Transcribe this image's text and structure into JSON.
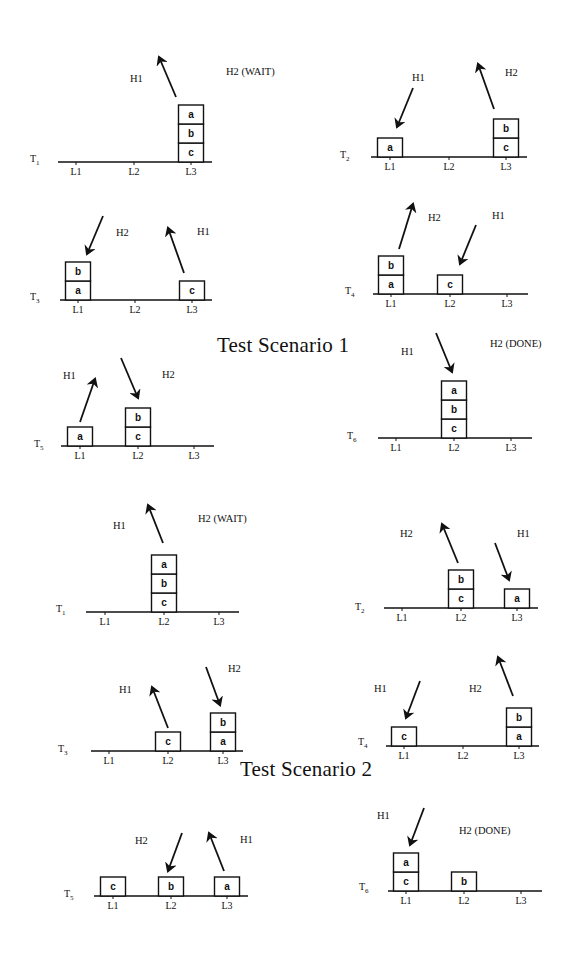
{
  "captions": [
    {
      "id": "scenario-1",
      "text": "Test Scenario 1",
      "x": 217,
      "y": 353
    },
    {
      "id": "scenario-2",
      "text": "Test Scenario 2",
      "x": 240,
      "y": 777
    }
  ],
  "colors": {
    "ink": "#111111",
    "background": "#ffffff"
  },
  "block_size": {
    "w": 25,
    "h": 19
  },
  "panels": [
    {
      "scenario": 1,
      "time": "T1",
      "sub": "1",
      "time_pos": [
        30,
        162
      ],
      "ground": {
        "x1": 58,
        "x2": 212,
        "y": 162
      },
      "locations": [
        {
          "name": "L1",
          "x": 76
        },
        {
          "name": "L2",
          "x": 134
        },
        {
          "name": "L3",
          "x": 191
        }
      ],
      "stacks": [
        {
          "loc": "L3",
          "blocks": [
            "c",
            "b",
            "a"
          ]
        }
      ],
      "arrows": [
        {
          "hand": "H1",
          "dir": "up",
          "x1": 176,
          "y1": 97,
          "x2": 159,
          "y2": 57
        }
      ],
      "hands": [
        {
          "text": "H1",
          "x": 130,
          "y": 82
        },
        {
          "text": "H2 (WAIT)",
          "x": 226,
          "y": 75
        }
      ]
    },
    {
      "scenario": 1,
      "time": "T2",
      "sub": "2",
      "time_pos": [
        340,
        158
      ],
      "ground": {
        "x1": 371,
        "x2": 527,
        "y": 157
      },
      "locations": [
        {
          "name": "L1",
          "x": 390
        },
        {
          "name": "L2",
          "x": 449
        },
        {
          "name": "L3",
          "x": 506
        }
      ],
      "stacks": [
        {
          "loc": "L1",
          "blocks": [
            "a"
          ]
        },
        {
          "loc": "L3",
          "blocks": [
            "c",
            "b"
          ]
        }
      ],
      "arrows": [
        {
          "hand": "H1",
          "dir": "down",
          "x1": 413,
          "y1": 88,
          "x2": 397,
          "y2": 127
        },
        {
          "hand": "H2",
          "dir": "up",
          "x1": 494,
          "y1": 109,
          "x2": 478,
          "y2": 64
        }
      ],
      "hands": [
        {
          "text": "H1",
          "x": 412,
          "y": 81
        },
        {
          "text": "H2",
          "x": 505,
          "y": 76
        }
      ]
    },
    {
      "scenario": 1,
      "time": "T3",
      "sub": "3",
      "time_pos": [
        30,
        300
      ],
      "ground": {
        "x1": 60,
        "x2": 212,
        "y": 300
      },
      "locations": [
        {
          "name": "L1",
          "x": 78
        },
        {
          "name": "L2",
          "x": 135
        },
        {
          "name": "L3",
          "x": 192
        }
      ],
      "stacks": [
        {
          "loc": "L1",
          "blocks": [
            "a",
            "b"
          ]
        },
        {
          "loc": "L3",
          "blocks": [
            "c"
          ]
        }
      ],
      "arrows": [
        {
          "hand": "H2",
          "dir": "down",
          "x1": 103,
          "y1": 216,
          "x2": 87,
          "y2": 254
        },
        {
          "hand": "H1",
          "dir": "up",
          "x1": 184,
          "y1": 273,
          "x2": 168,
          "y2": 228
        }
      ],
      "hands": [
        {
          "text": "H2",
          "x": 116,
          "y": 236
        },
        {
          "text": "H1",
          "x": 197,
          "y": 235
        }
      ]
    },
    {
      "scenario": 1,
      "time": "T4",
      "sub": "4",
      "time_pos": [
        345,
        294
      ],
      "ground": {
        "x1": 373,
        "x2": 528,
        "y": 294
      },
      "locations": [
        {
          "name": "L1",
          "x": 391
        },
        {
          "name": "L2",
          "x": 450
        },
        {
          "name": "L3",
          "x": 507
        }
      ],
      "stacks": [
        {
          "loc": "L1",
          "blocks": [
            "a",
            "b"
          ]
        },
        {
          "loc": "L2",
          "blocks": [
            "c"
          ]
        }
      ],
      "arrows": [
        {
          "hand": "H2",
          "dir": "up",
          "x1": 399,
          "y1": 249,
          "x2": 413,
          "y2": 204
        },
        {
          "hand": "H1",
          "dir": "down",
          "x1": 476,
          "y1": 225,
          "x2": 460,
          "y2": 264
        }
      ],
      "hands": [
        {
          "text": "H2",
          "x": 428,
          "y": 221
        },
        {
          "text": "H1",
          "x": 492,
          "y": 219
        }
      ]
    },
    {
      "scenario": 1,
      "time": "T5",
      "sub": "5",
      "time_pos": [
        34,
        447
      ],
      "ground": {
        "x1": 61,
        "x2": 214,
        "y": 446
      },
      "locations": [
        {
          "name": "L1",
          "x": 80
        },
        {
          "name": "L2",
          "x": 138
        },
        {
          "name": "L3",
          "x": 194
        }
      ],
      "stacks": [
        {
          "loc": "L1",
          "blocks": [
            "a"
          ]
        },
        {
          "loc": "L2",
          "blocks": [
            "c",
            "b"
          ]
        }
      ],
      "arrows": [
        {
          "hand": "H1",
          "dir": "up",
          "x1": 80,
          "y1": 422,
          "x2": 95,
          "y2": 379
        },
        {
          "hand": "H2",
          "dir": "down",
          "x1": 121,
          "y1": 358,
          "x2": 138,
          "y2": 398
        }
      ],
      "hands": [
        {
          "text": "H1",
          "x": 63,
          "y": 379
        },
        {
          "text": "H2",
          "x": 162,
          "y": 378
        }
      ]
    },
    {
      "scenario": 1,
      "time": "T6",
      "sub": "6",
      "time_pos": [
        347,
        439
      ],
      "ground": {
        "x1": 378,
        "x2": 532,
        "y": 438
      },
      "locations": [
        {
          "name": "L1",
          "x": 396
        },
        {
          "name": "L2",
          "x": 454
        },
        {
          "name": "L3",
          "x": 511
        }
      ],
      "stacks": [
        {
          "loc": "L2",
          "blocks": [
            "c",
            "b",
            "a"
          ]
        }
      ],
      "arrows": [
        {
          "hand": "H1",
          "dir": "down",
          "x1": 436,
          "y1": 333,
          "x2": 452,
          "y2": 372
        }
      ],
      "hands": [
        {
          "text": "H1",
          "x": 401,
          "y": 355
        },
        {
          "text": "H2 (DONE)",
          "x": 490,
          "y": 347
        }
      ]
    },
    {
      "scenario": 2,
      "time": "T1",
      "sub": "1",
      "time_pos": [
        56,
        612
      ],
      "ground": {
        "x1": 86,
        "x2": 239,
        "y": 612
      },
      "locations": [
        {
          "name": "L1",
          "x": 105
        },
        {
          "name": "L2",
          "x": 164
        },
        {
          "name": "L3",
          "x": 219
        }
      ],
      "stacks": [
        {
          "loc": "L2",
          "blocks": [
            "c",
            "b",
            "a"
          ]
        }
      ],
      "arrows": [
        {
          "hand": "H1",
          "dir": "up",
          "x1": 163,
          "y1": 543,
          "x2": 148,
          "y2": 505
        }
      ],
      "hands": [
        {
          "text": "H1",
          "x": 113,
          "y": 529
        },
        {
          "text": "H2 (WAIT)",
          "x": 198,
          "y": 522
        }
      ]
    },
    {
      "scenario": 2,
      "time": "T2",
      "sub": "2",
      "time_pos": [
        355,
        610
      ],
      "ground": {
        "x1": 384,
        "x2": 538,
        "y": 608
      },
      "locations": [
        {
          "name": "L1",
          "x": 402
        },
        {
          "name": "L2",
          "x": 461
        },
        {
          "name": "L3",
          "x": 517
        }
      ],
      "stacks": [
        {
          "loc": "L2",
          "blocks": [
            "c",
            "b"
          ]
        },
        {
          "loc": "L3",
          "blocks": [
            "a"
          ]
        }
      ],
      "arrows": [
        {
          "hand": "H2",
          "dir": "up",
          "x1": 458,
          "y1": 563,
          "x2": 442,
          "y2": 524
        },
        {
          "hand": "H1",
          "dir": "down",
          "x1": 495,
          "y1": 543,
          "x2": 509,
          "y2": 580
        }
      ],
      "hands": [
        {
          "text": "H2",
          "x": 400,
          "y": 537
        },
        {
          "text": "H1",
          "x": 517,
          "y": 537
        }
      ]
    },
    {
      "scenario": 2,
      "time": "T3",
      "sub": "3",
      "time_pos": [
        58,
        752
      ],
      "ground": {
        "x1": 91,
        "x2": 243,
        "y": 751
      },
      "locations": [
        {
          "name": "L1",
          "x": 109
        },
        {
          "name": "L2",
          "x": 168
        },
        {
          "name": "L3",
          "x": 223
        }
      ],
      "stacks": [
        {
          "loc": "L2",
          "blocks": [
            "c"
          ]
        },
        {
          "loc": "L3",
          "blocks": [
            "a",
            "b"
          ]
        }
      ],
      "arrows": [
        {
          "hand": "H1",
          "dir": "up",
          "x1": 168,
          "y1": 728,
          "x2": 152,
          "y2": 687
        },
        {
          "hand": "H2",
          "dir": "down",
          "x1": 206,
          "y1": 667,
          "x2": 220,
          "y2": 705
        }
      ],
      "hands": [
        {
          "text": "H1",
          "x": 119,
          "y": 693
        },
        {
          "text": "H2",
          "x": 228,
          "y": 672
        }
      ]
    },
    {
      "scenario": 2,
      "time": "T4",
      "sub": "4",
      "time_pos": [
        358,
        745
      ],
      "ground": {
        "x1": 386,
        "x2": 539,
        "y": 746
      },
      "locations": [
        {
          "name": "L1",
          "x": 404
        },
        {
          "name": "L2",
          "x": 463
        },
        {
          "name": "L3",
          "x": 519
        }
      ],
      "stacks": [
        {
          "loc": "L1",
          "blocks": [
            "c"
          ]
        },
        {
          "loc": "L3",
          "blocks": [
            "a",
            "b"
          ]
        }
      ],
      "arrows": [
        {
          "hand": "H1",
          "dir": "down",
          "x1": 420,
          "y1": 681,
          "x2": 406,
          "y2": 718
        },
        {
          "hand": "H2",
          "dir": "up",
          "x1": 513,
          "y1": 696,
          "x2": 498,
          "y2": 657
        }
      ],
      "hands": [
        {
          "text": "H1",
          "x": 374,
          "y": 692
        },
        {
          "text": "H2",
          "x": 469,
          "y": 692
        }
      ]
    },
    {
      "scenario": 2,
      "time": "T5",
      "sub": "5",
      "time_pos": [
        64,
        897
      ],
      "ground": {
        "x1": 94,
        "x2": 248,
        "y": 896
      },
      "locations": [
        {
          "name": "L1",
          "x": 113
        },
        {
          "name": "L2",
          "x": 171
        },
        {
          "name": "L3",
          "x": 227
        }
      ],
      "stacks": [
        {
          "loc": "L1",
          "blocks": [
            "c"
          ]
        },
        {
          "loc": "L2",
          "blocks": [
            "b"
          ]
        },
        {
          "loc": "L3",
          "blocks": [
            "a"
          ]
        }
      ],
      "arrows": [
        {
          "hand": "H2",
          "dir": "down",
          "x1": 182,
          "y1": 833,
          "x2": 168,
          "y2": 871
        },
        {
          "hand": "H1",
          "dir": "up",
          "x1": 224,
          "y1": 871,
          "x2": 209,
          "y2": 833
        }
      ],
      "hands": [
        {
          "text": "H2",
          "x": 135,
          "y": 844
        },
        {
          "text": "H1",
          "x": 240,
          "y": 843
        }
      ]
    },
    {
      "scenario": 2,
      "time": "T6",
      "sub": "6",
      "time_pos": [
        359,
        890
      ],
      "ground": {
        "x1": 388,
        "x2": 542,
        "y": 891
      },
      "locations": [
        {
          "name": "L1",
          "x": 406
        },
        {
          "name": "L2",
          "x": 464
        },
        {
          "name": "L3",
          "x": 521
        }
      ],
      "stacks": [
        {
          "loc": "L1",
          "blocks": [
            "c",
            "a"
          ]
        },
        {
          "loc": "L2",
          "blocks": [
            "b"
          ]
        }
      ],
      "arrows": [
        {
          "hand": "H1",
          "dir": "down",
          "x1": 424,
          "y1": 808,
          "x2": 410,
          "y2": 845
        }
      ],
      "hands": [
        {
          "text": "H1",
          "x": 377,
          "y": 819
        },
        {
          "text": "H2 (DONE)",
          "x": 459,
          "y": 834
        }
      ]
    }
  ]
}
